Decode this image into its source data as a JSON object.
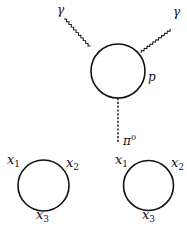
{
  "diagram": {
    "type": "feynman-diagram",
    "colors": {
      "line": "#111111",
      "background": "#ffffff"
    },
    "top_loop": {
      "description": "fermion triangle loop (anomaly diagram)",
      "loop_label": "p",
      "direction": "counterclockwise",
      "photon_left_label": "γ",
      "photon_right_label": "γ",
      "pion_label": "π",
      "pion_superscript": "0"
    },
    "bottom_left_loop": {
      "vertex_labels": [
        "x",
        "x",
        "x"
      ],
      "vertex_subscripts": [
        "1",
        "2",
        "3"
      ],
      "direction": "clockwise"
    },
    "bottom_right_loop": {
      "vertex_labels": [
        "x",
        "x",
        "x"
      ],
      "vertex_subscripts": [
        "1",
        "2",
        "3"
      ],
      "direction": "counterclockwise"
    }
  }
}
